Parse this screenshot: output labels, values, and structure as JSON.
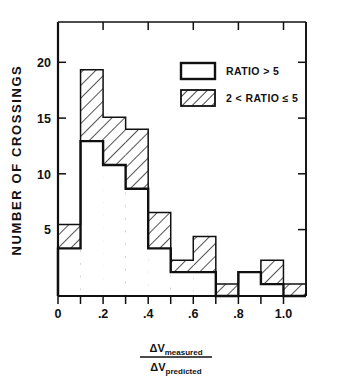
{
  "chart_data": {
    "type": "bar",
    "title": "",
    "xlabel": "ΔV_measured / ΔV_predicted",
    "ylabel": "NUMBER OF CROSSINGS",
    "xlim": [
      0,
      1.1
    ],
    "ylim": [
      0,
      23
    ],
    "bin_width": 0.1,
    "grid": false,
    "legend_position": "top-right",
    "x_ticks": [
      "0",
      ".2",
      ".4",
      ".6",
      ".8",
      "1.0"
    ],
    "x_tick_values": [
      0,
      0.2,
      0.4,
      0.6,
      0.8,
      1.0
    ],
    "y_ticks": [
      "5",
      "10",
      "15",
      "20"
    ],
    "y_tick_values": [
      5,
      10,
      15,
      20
    ],
    "bin_starts": [
      0.0,
      0.1,
      0.2,
      0.3,
      0.4,
      0.5,
      0.6,
      0.7,
      0.8,
      0.9,
      1.0
    ],
    "series": [
      {
        "name": "RATIO > 5",
        "fill": "solid",
        "values": [
          4,
          13,
          11,
          9,
          4,
          2,
          2,
          0,
          2,
          1,
          0
        ]
      },
      {
        "name": "2 < RATIO ≤ 5",
        "fill": "hatched",
        "values": [
          2,
          6,
          4,
          5,
          3,
          1,
          3,
          1,
          0,
          2,
          1
        ]
      }
    ],
    "totals": [
      6,
      19,
      15,
      14,
      7,
      3,
      5,
      1,
      2,
      3,
      1
    ]
  },
  "axes": {
    "y_title": "NUMBER OF CROSSINGS",
    "x_title_numerator": "ΔV",
    "x_title_numerator_sub": "measured",
    "x_title_denominator": "ΔV",
    "x_title_denominator_sub": "predicted"
  },
  "legend": {
    "entries": [
      {
        "label": "RATIO > 5",
        "swatch": "open-rectangle-swatch"
      },
      {
        "label": "2 < RATIO ≤ 5",
        "swatch": "hatched-rectangle-swatch"
      }
    ]
  },
  "colors": {
    "line": "#101010",
    "background": "#ffffff",
    "hatch": "#1a1a1a"
  }
}
